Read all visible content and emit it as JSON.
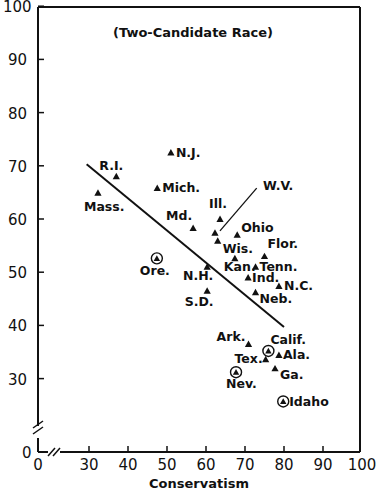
{
  "chart_data": {
    "type": "scatter",
    "title": "(Two-Candidate Race)",
    "xlabel": "Conservatism",
    "ylabel": "",
    "xlim": [
      0,
      100
    ],
    "ylim": [
      0,
      100
    ],
    "x_axis_break": true,
    "y_axis_break": true,
    "grid": false,
    "x_ticks": [
      "0",
      "30",
      "40",
      "50",
      "60",
      "70",
      "80",
      "90",
      "100"
    ],
    "y_ticks": [
      "0",
      "30",
      "40",
      "50",
      "60",
      "70",
      "80",
      "90",
      "100"
    ],
    "points": [
      {
        "label": "Mass.",
        "x": 32.3,
        "y": 64.9,
        "circled": false
      },
      {
        "label": "R.I.",
        "x": 37.0,
        "y": 68.0,
        "circled": false
      },
      {
        "label": "N.J.",
        "x": 51.0,
        "y": 72.5,
        "circled": false
      },
      {
        "label": "Mich.",
        "x": 47.5,
        "y": 65.8,
        "circled": false
      },
      {
        "label": "Md.",
        "x": 56.7,
        "y": 58.3,
        "circled": false
      },
      {
        "label": "Ill.",
        "x": 63.6,
        "y": 60.0,
        "circled": false
      },
      {
        "label": "W.V.",
        "x": 62.3,
        "y": 57.4,
        "circled": false
      },
      {
        "label": "Wis.",
        "x": 63.0,
        "y": 55.9,
        "circled": false
      },
      {
        "label": "Ohio",
        "x": 68.0,
        "y": 57.0,
        "circled": false
      },
      {
        "label": "Flor.",
        "x": 75.0,
        "y": 53.0,
        "circled": false
      },
      {
        "label": "Kan.",
        "x": 67.4,
        "y": 52.6,
        "circled": false
      },
      {
        "label": "Tenn.",
        "x": 72.7,
        "y": 51.0,
        "circled": false
      },
      {
        "label": "N.H.",
        "x": 60.3,
        "y": 51.0,
        "circled": false
      },
      {
        "label": "S.D.",
        "x": 60.3,
        "y": 46.5,
        "circled": false
      },
      {
        "label": "Ind.",
        "x": 70.8,
        "y": 49.0,
        "circled": false
      },
      {
        "label": "N.C.",
        "x": 78.7,
        "y": 47.4,
        "circled": false
      },
      {
        "label": "Neb.",
        "x": 72.7,
        "y": 46.2,
        "circled": false
      },
      {
        "label": "Ore.",
        "x": 47.4,
        "y": 52.6,
        "circled": true
      },
      {
        "label": "Ark.",
        "x": 70.9,
        "y": 36.5,
        "circled": false
      },
      {
        "label": "Calif.",
        "x": 76.0,
        "y": 35.2,
        "circled": true
      },
      {
        "label": "Tex.",
        "x": 75.3,
        "y": 33.6,
        "circled": false
      },
      {
        "label": "Ala.",
        "x": 78.7,
        "y": 34.4,
        "circled": false
      },
      {
        "label": "Ga.",
        "x": 77.7,
        "y": 31.9,
        "circled": false
      },
      {
        "label": "Nev.",
        "x": 67.7,
        "y": 31.2,
        "circled": true
      },
      {
        "label": "Idaho",
        "x": 79.8,
        "y": 25.7,
        "circled": true
      }
    ],
    "regression_line": {
      "x1": 29.4,
      "y1": 70.3,
      "x2": 80.0,
      "y2": 39.7
    },
    "annotations": [
      {
        "text": "W.V.",
        "leader_from": [
          62.3,
          57.4
        ],
        "leader_to": [
          73.0,
          65.8
        ]
      }
    ]
  }
}
